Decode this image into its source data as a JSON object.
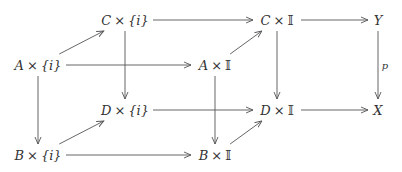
{
  "diagram": {
    "nodes": [
      {
        "id": "C_i",
        "obj": "C",
        "op": "×",
        "set": "{i}",
        "set_italic": true
      },
      {
        "id": "C_I",
        "obj": "C",
        "op": "×",
        "set": "𝕀",
        "set_italic": false
      },
      {
        "id": "Y",
        "obj": "Y",
        "op": "",
        "set": "",
        "set_italic": false
      },
      {
        "id": "A_i",
        "obj": "A",
        "op": "×",
        "set": "{i}",
        "set_italic": true
      },
      {
        "id": "A_I",
        "obj": "A",
        "op": "×",
        "set": "𝕀",
        "set_italic": false
      },
      {
        "id": "D_i",
        "obj": "D",
        "op": "×",
        "set": "{i}",
        "set_italic": true
      },
      {
        "id": "D_I",
        "obj": "D",
        "op": "×",
        "set": "𝕀",
        "set_italic": false
      },
      {
        "id": "X",
        "obj": "X",
        "op": "",
        "set": "",
        "set_italic": false
      },
      {
        "id": "B_i",
        "obj": "B",
        "op": "×",
        "set": "{i}",
        "set_italic": true
      },
      {
        "id": "B_I",
        "obj": "B",
        "op": "×",
        "set": "𝕀",
        "set_italic": false
      }
    ],
    "arrows": [
      {
        "from": "C_i",
        "to": "C_I",
        "label": ""
      },
      {
        "from": "C_I",
        "to": "Y",
        "label": ""
      },
      {
        "from": "A_i",
        "to": "C_i",
        "label": ""
      },
      {
        "from": "A_i",
        "to": "A_I",
        "label": ""
      },
      {
        "from": "A_I",
        "to": "C_I",
        "label": ""
      },
      {
        "from": "C_i",
        "to": "D_i",
        "label": ""
      },
      {
        "from": "C_I",
        "to": "D_I",
        "label": ""
      },
      {
        "from": "Y",
        "to": "X",
        "label": "p"
      },
      {
        "from": "A_i",
        "to": "B_i",
        "label": ""
      },
      {
        "from": "A_I",
        "to": "B_I",
        "label": ""
      },
      {
        "from": "D_i",
        "to": "D_I",
        "label": ""
      },
      {
        "from": "D_I",
        "to": "X",
        "label": ""
      },
      {
        "from": "B_i",
        "to": "D_i",
        "label": ""
      },
      {
        "from": "B_i",
        "to": "B_I",
        "label": ""
      },
      {
        "from": "B_I",
        "to": "D_I",
        "label": ""
      }
    ],
    "colors": {
      "stroke": "#555555",
      "text": "#333333"
    }
  }
}
